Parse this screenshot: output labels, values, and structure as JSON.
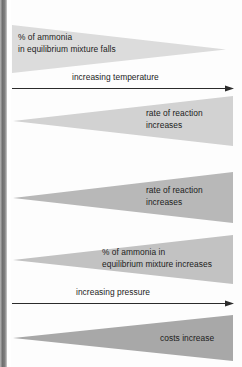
{
  "figure": {
    "background_color": "#fdfdfd",
    "scan_edge_color": "#6f6f6f"
  },
  "wedges": [
    {
      "id": "ammonia-falls",
      "direction": "right",
      "fill": "#dcdcdc",
      "line1": "% of ammonia",
      "line2": "in equilibrium mixture falls"
    },
    {
      "id": "rate-increases-temperature",
      "direction": "left",
      "fill": "#d2d2d2",
      "line1": "rate of reaction",
      "line2": "increases"
    },
    {
      "id": "rate-increases-pressure",
      "direction": "left",
      "fill": "#b8b8b8",
      "line1": "rate of reaction",
      "line2": "increases"
    },
    {
      "id": "ammonia-increases",
      "direction": "left",
      "fill": "#c2c2c2",
      "line1": "% of ammonia in",
      "line2": "equilibrium mixture increases"
    },
    {
      "id": "costs-increase",
      "direction": "left",
      "fill": "#a8a8a8",
      "line1": "costs increase",
      "line2": ""
    }
  ],
  "axes": [
    {
      "id": "temperature-axis",
      "label": "increasing temperature",
      "color": "#2b2b2b"
    },
    {
      "id": "pressure-axis",
      "label": "increasing pressure",
      "color": "#2b2b2b"
    }
  ]
}
